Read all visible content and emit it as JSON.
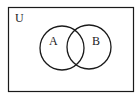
{
  "diagram": {
    "type": "venn",
    "universe": {
      "label": "U"
    },
    "sets": [
      {
        "label": "A"
      },
      {
        "label": "B"
      }
    ],
    "colors": {
      "stroke": "#1a1a1a",
      "background": "#ffffff"
    }
  }
}
